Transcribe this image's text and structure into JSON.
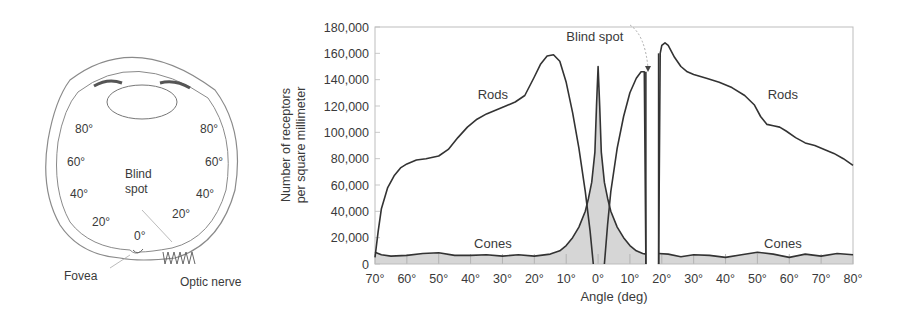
{
  "eye_diagram": {
    "labels_left": [
      "80°",
      "60°",
      "40°",
      "20°"
    ],
    "labels_right": [
      "80°",
      "60°",
      "40°",
      "20°"
    ],
    "center_label": "0°",
    "blind_spot_label_line1": "Blind",
    "blind_spot_label_line2": "spot",
    "fovea_label": "Fovea",
    "optic_nerve_label": "Optic nerve"
  },
  "chart_data": {
    "type": "area",
    "title": "",
    "xlabel": "Angle (deg)",
    "ylabel_line1": "Number of receptors",
    "ylabel_line2": "per square millimeter",
    "xlim": [
      -70,
      80
    ],
    "ylim": [
      0,
      180000
    ],
    "x_ticks": [
      -70,
      -60,
      -50,
      -40,
      -30,
      -20,
      -10,
      0,
      10,
      20,
      30,
      40,
      50,
      60,
      70,
      80
    ],
    "x_tick_labels": [
      "70°",
      "60°",
      "50°",
      "40°",
      "30°",
      "20°",
      "10°",
      "0°",
      "10°",
      "20°",
      "30°",
      "40°",
      "50°",
      "60°",
      "70°",
      "80°"
    ],
    "y_ticks": [
      0,
      20000,
      40000,
      60000,
      80000,
      100000,
      120000,
      140000,
      160000,
      180000
    ],
    "y_tick_labels": [
      "0",
      "20,000",
      "40,000",
      "60,000",
      "80,000",
      "100,000",
      "120,000",
      "140,000",
      "160,000",
      "180,000"
    ],
    "grid": false,
    "annotations": [
      {
        "text": "Rods",
        "x": -33,
        "y": 125000
      },
      {
        "text": "Rods",
        "x": 58,
        "y": 125000
      },
      {
        "text": "Cones",
        "x": -33,
        "y": 12000
      },
      {
        "text": "Cones",
        "x": 58,
        "y": 12000
      },
      {
        "text": "Blind spot",
        "x": -1,
        "y": 169000
      }
    ],
    "blind_spot_range": [
      15,
      19
    ],
    "series": [
      {
        "name": "Rods",
        "segments": [
          {
            "x": [
              -70,
              -69,
              -68,
              -66,
              -64,
              -62,
              -60,
              -57,
              -54,
              -50,
              -47,
              -44,
              -41,
              -38,
              -35,
              -32,
              -29,
              -26,
              -23,
              -20,
              -18,
              -16,
              -14,
              -12,
              -10,
              -8,
              -6,
              -4,
              -2.5,
              -1.5
            ],
            "y": [
              5000,
              25000,
              42000,
              58000,
              67000,
              73000,
              76000,
              79000,
              80000,
              82000,
              87000,
              96000,
              104000,
              110000,
              114000,
              117000,
              120000,
              123000,
              128000,
              142000,
              152000,
              158000,
              159000,
              154000,
              138000,
              115000,
              88000,
              55000,
              25000,
              0
            ]
          },
          {
            "x": [
              2,
              3,
              4,
              6,
              8,
              10,
              12,
              13.5,
              14.5,
              15
            ],
            "y": [
              0,
              30000,
              55000,
              88000,
              112000,
              130000,
              141000,
              146000,
              146000,
              0
            ]
          },
          {
            "x": [
              19,
              19.5,
              20,
              21,
              22,
              24,
              26,
              28,
              30,
              34,
              38,
              42,
              46,
              49,
              51,
              53,
              55,
              57,
              59,
              62,
              65,
              68,
              71,
              74,
              77,
              80
            ],
            "y": [
              0,
              160000,
              166000,
              168000,
              166000,
              157000,
              150000,
              146000,
              144000,
              141000,
              138000,
              134000,
              128000,
              121000,
              112000,
              106000,
              105000,
              104000,
              101000,
              96000,
              92000,
              90000,
              87000,
              84000,
              80000,
              75000
            ]
          }
        ]
      },
      {
        "name": "Cones",
        "fill": "#d6d6d6",
        "segments": [
          {
            "x": [
              -70,
              -68,
              -65,
              -60,
              -55,
              -50,
              -45,
              -40,
              -35,
              -30,
              -25,
              -20,
              -15,
              -12,
              -10,
              -8,
              -6,
              -4,
              -3,
              -2,
              -1,
              -0.5,
              0,
              0.5,
              1,
              2,
              3,
              4,
              6,
              8,
              10,
              12,
              14,
              15
            ],
            "y": [
              9000,
              7000,
              6000,
              6500,
              8000,
              8500,
              6500,
              6500,
              7000,
              6000,
              7000,
              6000,
              7500,
              10000,
              14000,
              20000,
              28000,
              40000,
              50000,
              62000,
              85000,
              120000,
              150000,
              120000,
              85000,
              62000,
              50000,
              40000,
              28000,
              20000,
              14000,
              10000,
              8000,
              7500
            ]
          },
          {
            "x": [
              19,
              22,
              26,
              30,
              35,
              40,
              45,
              50,
              55,
              60,
              65,
              70,
              75,
              80
            ],
            "y": [
              8000,
              7500,
              5500,
              7000,
              6500,
              5000,
              7000,
              9000,
              7500,
              5000,
              7500,
              6000,
              8000,
              7000
            ]
          }
        ]
      }
    ]
  }
}
